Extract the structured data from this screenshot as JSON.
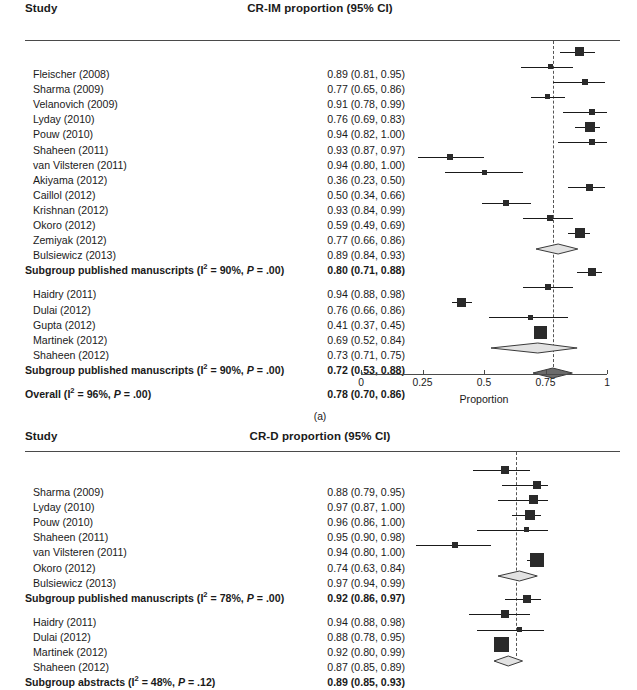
{
  "figure": {
    "caption_a": "(a)",
    "study_header": "Study"
  },
  "panel_a": {
    "effect_header": "CR-IM proportion (95% CI)",
    "axis": {
      "title": "Proportion",
      "ticks": [
        "0",
        "0.25",
        "0.5",
        "0.75",
        "1"
      ],
      "tick_values": [
        0,
        0.25,
        0.5,
        0.75,
        1
      ],
      "range": [
        0,
        1
      ]
    },
    "refline": 0.78,
    "rows": [
      {
        "label": "Fleischer (2008)",
        "value": "0.89 (0.81, 0.95)",
        "est": 0.89,
        "lo": 0.81,
        "hi": 0.95,
        "w": 9,
        "type": "study"
      },
      {
        "label": "Sharma (2009)",
        "value": "0.77 (0.65, 0.86)",
        "est": 0.77,
        "lo": 0.65,
        "hi": 0.86,
        "w": 5,
        "type": "study"
      },
      {
        "label": "Velanovich (2009)",
        "value": "0.91 (0.78, 0.99)",
        "est": 0.91,
        "lo": 0.78,
        "hi": 0.99,
        "w": 6,
        "type": "study"
      },
      {
        "label": "Lyday (2010)",
        "value": "0.76 (0.69, 0.83)",
        "est": 0.76,
        "lo": 0.69,
        "hi": 0.83,
        "w": 5,
        "type": "study"
      },
      {
        "label": "Pouw (2010)",
        "value": "0.94 (0.82, 1.00)",
        "est": 0.94,
        "lo": 0.82,
        "hi": 1.0,
        "w": 6,
        "type": "study"
      },
      {
        "label": "Shaheen (2011)",
        "value": "0.93 (0.87, 0.97)",
        "est": 0.93,
        "lo": 0.87,
        "hi": 0.97,
        "w": 10,
        "type": "study"
      },
      {
        "label": "van Vilsteren (2011)",
        "value": "0.94 (0.80, 1.00)",
        "est": 0.94,
        "lo": 0.8,
        "hi": 1.0,
        "w": 6,
        "type": "study"
      },
      {
        "label": "Akiyama (2012)",
        "value": "0.36 (0.23, 0.50)",
        "est": 0.36,
        "lo": 0.23,
        "hi": 0.5,
        "w": 6,
        "type": "study"
      },
      {
        "label": "Caillol (2012)",
        "value": "0.50 (0.34, 0.66)",
        "est": 0.5,
        "lo": 0.34,
        "hi": 0.66,
        "w": 5,
        "type": "study"
      },
      {
        "label": "Krishnan (2012)",
        "value": "0.93 (0.84, 0.99)",
        "est": 0.93,
        "lo": 0.84,
        "hi": 0.99,
        "w": 7,
        "type": "study"
      },
      {
        "label": "Okoro (2012)",
        "value": "0.59 (0.49, 0.69)",
        "est": 0.59,
        "lo": 0.49,
        "hi": 0.69,
        "w": 6,
        "type": "study"
      },
      {
        "label": "Zemiyak (2012)",
        "value": "0.77 (0.66, 0.86)",
        "est": 0.77,
        "lo": 0.66,
        "hi": 0.86,
        "w": 6,
        "type": "study"
      },
      {
        "label": "Bulsiewicz (2013)",
        "value": "0.89 (0.84, 0.93)",
        "est": 0.89,
        "lo": 0.84,
        "hi": 0.93,
        "w": 10,
        "type": "study"
      },
      {
        "label_html": "Subgroup published manuscripts (I<sup>2</sup> = 90%, <span class=\"ital\">P</span> = .00)",
        "value": "0.80 (0.71, 0.88)",
        "est": 0.8,
        "lo": 0.71,
        "hi": 0.88,
        "type": "summary"
      },
      {
        "type": "gap"
      },
      {
        "label": "Haidry (2011)",
        "value": "0.94 (0.88, 0.98)",
        "est": 0.94,
        "lo": 0.88,
        "hi": 0.98,
        "w": 8,
        "type": "study"
      },
      {
        "label": "Dulai (2012)",
        "value": "0.76 (0.66, 0.86)",
        "est": 0.76,
        "lo": 0.66,
        "hi": 0.86,
        "w": 6,
        "type": "study"
      },
      {
        "label": "Gupta (2012)",
        "value": "0.41 (0.37, 0.45)",
        "est": 0.41,
        "lo": 0.37,
        "hi": 0.45,
        "w": 9,
        "type": "study"
      },
      {
        "label": "Martinek (2012)",
        "value": "0.69 (0.52, 0.84)",
        "est": 0.69,
        "lo": 0.52,
        "hi": 0.84,
        "w": 5,
        "type": "study"
      },
      {
        "label": "Shaheen (2012)",
        "value": "0.73 (0.71, 0.75)",
        "est": 0.73,
        "lo": 0.71,
        "hi": 0.75,
        "w": 13,
        "type": "study"
      },
      {
        "label_html": "Subgroup published manuscripts (I<sup>2</sup> = 90%, <span class=\"ital\">P</span> = .00)",
        "value": "0.72 (0.53, 0.88)",
        "est": 0.72,
        "lo": 0.53,
        "hi": 0.88,
        "type": "summary"
      },
      {
        "type": "gap"
      },
      {
        "label_html": "Overall (I<sup>2</sup> = 96%, <span class=\"ital\">P</span> = .00)",
        "value": "0.78 (0.70, 0.86)",
        "est": 0.78,
        "lo": 0.7,
        "hi": 0.86,
        "type": "overall"
      }
    ]
  },
  "panel_b": {
    "effect_header": "CR-D proportion (95% CI)",
    "refline": 0.91,
    "axis": {
      "range": [
        0.5,
        1.0
      ]
    },
    "rows": [
      {
        "label": "Sharma (2009)",
        "value": "0.88 (0.79, 0.95)",
        "est": 0.88,
        "lo": 0.79,
        "hi": 0.95,
        "w": 8,
        "type": "study"
      },
      {
        "label": "Lyday (2010)",
        "value": "0.97 (0.87, 1.00)",
        "est": 0.97,
        "lo": 0.87,
        "hi": 1.0,
        "w": 8,
        "type": "study"
      },
      {
        "label": "Pouw (2010)",
        "value": "0.96 (0.86, 1.00)",
        "est": 0.96,
        "lo": 0.86,
        "hi": 1.0,
        "w": 9,
        "type": "study"
      },
      {
        "label": "Shaheen (2011)",
        "value": "0.95 (0.90, 0.98)",
        "est": 0.95,
        "lo": 0.9,
        "hi": 0.98,
        "w": 10,
        "type": "study"
      },
      {
        "label": "van Vilsteren (2011)",
        "value": "0.94 (0.80, 1.00)",
        "est": 0.94,
        "lo": 0.8,
        "hi": 1.0,
        "w": 5,
        "type": "study"
      },
      {
        "label": "Okoro (2012)",
        "value": "0.74 (0.63, 0.84)",
        "est": 0.74,
        "lo": 0.63,
        "hi": 0.84,
        "w": 6,
        "type": "study"
      },
      {
        "label": "Bulsiewicz (2013)",
        "value": "0.97 (0.94, 0.99)",
        "est": 0.97,
        "lo": 0.94,
        "hi": 0.99,
        "w": 14,
        "type": "study"
      },
      {
        "label_html": "Subgroup published manuscripts (I<sup>2</sup> = 78%, <span class=\"ital\">P</span> = .00)",
        "value": "0.92 (0.86, 0.97)",
        "est": 0.92,
        "lo": 0.86,
        "hi": 0.97,
        "type": "summary"
      },
      {
        "type": "gap"
      },
      {
        "label": "Haidry (2011)",
        "value": "0.94 (0.88, 0.98)",
        "est": 0.94,
        "lo": 0.88,
        "hi": 0.98,
        "w": 8,
        "type": "study"
      },
      {
        "label": "Dulai (2012)",
        "value": "0.88 (0.78, 0.95)",
        "est": 0.88,
        "lo": 0.78,
        "hi": 0.95,
        "w": 8,
        "type": "study"
      },
      {
        "label": "Martinek (2012)",
        "value": "0.92 (0.80, 0.99)",
        "est": 0.92,
        "lo": 0.8,
        "hi": 0.99,
        "w": 5,
        "type": "study"
      },
      {
        "label": "Shaheen (2012)",
        "value": "0.87 (0.85, 0.89)",
        "est": 0.87,
        "lo": 0.85,
        "hi": 0.89,
        "w": 15,
        "type": "study"
      },
      {
        "label_html": "Subgroup abstracts (I<sup>2</sup> = 48%, <span class=\"ital\">P</span> = .12)",
        "value": "0.89 (0.85, 0.93)",
        "est": 0.89,
        "lo": 0.85,
        "hi": 0.93,
        "type": "summary"
      }
    ]
  },
  "chart_data": {
    "type": "forest",
    "panels": [
      {
        "id": "a",
        "effect_measure": "CR-IM proportion (95% CI)",
        "xlabel": "Proportion",
        "xlim": [
          0,
          1
        ],
        "xticks": [
          0,
          0.25,
          0.5,
          0.75,
          1
        ],
        "refline": 0.78,
        "subgroups": [
          {
            "name": "Subgroup published manuscripts",
            "heterogeneity": {
              "I2": "90%",
              "P": ".00"
            },
            "pooled": {
              "est": 0.8,
              "lo": 0.71,
              "hi": 0.88
            },
            "studies": [
              {
                "study": "Fleischer (2008)",
                "est": 0.89,
                "lo": 0.81,
                "hi": 0.95
              },
              {
                "study": "Sharma (2009)",
                "est": 0.77,
                "lo": 0.65,
                "hi": 0.86
              },
              {
                "study": "Velanovich (2009)",
                "est": 0.91,
                "lo": 0.78,
                "hi": 0.99
              },
              {
                "study": "Lyday (2010)",
                "est": 0.76,
                "lo": 0.69,
                "hi": 0.83
              },
              {
                "study": "Pouw (2010)",
                "est": 0.94,
                "lo": 0.82,
                "hi": 1.0
              },
              {
                "study": "Shaheen (2011)",
                "est": 0.93,
                "lo": 0.87,
                "hi": 0.97
              },
              {
                "study": "van Vilsteren (2011)",
                "est": 0.94,
                "lo": 0.8,
                "hi": 1.0
              },
              {
                "study": "Akiyama (2012)",
                "est": 0.36,
                "lo": 0.23,
                "hi": 0.5
              },
              {
                "study": "Caillol (2012)",
                "est": 0.5,
                "lo": 0.34,
                "hi": 0.66
              },
              {
                "study": "Krishnan (2012)",
                "est": 0.93,
                "lo": 0.84,
                "hi": 0.99
              },
              {
                "study": "Okoro (2012)",
                "est": 0.59,
                "lo": 0.49,
                "hi": 0.69
              },
              {
                "study": "Zemiyak (2012)",
                "est": 0.77,
                "lo": 0.66,
                "hi": 0.86
              },
              {
                "study": "Bulsiewicz (2013)",
                "est": 0.89,
                "lo": 0.84,
                "hi": 0.93
              }
            ]
          },
          {
            "name": "Subgroup published manuscripts",
            "heterogeneity": {
              "I2": "90%",
              "P": ".00"
            },
            "pooled": {
              "est": 0.72,
              "lo": 0.53,
              "hi": 0.88
            },
            "studies": [
              {
                "study": "Haidry (2011)",
                "est": 0.94,
                "lo": 0.88,
                "hi": 0.98
              },
              {
                "study": "Dulai (2012)",
                "est": 0.76,
                "lo": 0.66,
                "hi": 0.86
              },
              {
                "study": "Gupta (2012)",
                "est": 0.41,
                "lo": 0.37,
                "hi": 0.45
              },
              {
                "study": "Martinek (2012)",
                "est": 0.69,
                "lo": 0.52,
                "hi": 0.84
              },
              {
                "study": "Shaheen (2012)",
                "est": 0.73,
                "lo": 0.71,
                "hi": 0.75
              }
            ]
          }
        ],
        "overall": {
          "label": "Overall",
          "heterogeneity": {
            "I2": "96%",
            "P": ".00"
          },
          "est": 0.78,
          "lo": 0.7,
          "hi": 0.86
        }
      },
      {
        "id": "b",
        "effect_measure": "CR-D proportion (95% CI)",
        "xlim": [
          0.5,
          1.0
        ],
        "refline": 0.91,
        "subgroups": [
          {
            "name": "Subgroup published manuscripts",
            "heterogeneity": {
              "I2": "78%",
              "P": ".00"
            },
            "pooled": {
              "est": 0.92,
              "lo": 0.86,
              "hi": 0.97
            },
            "studies": [
              {
                "study": "Sharma (2009)",
                "est": 0.88,
                "lo": 0.79,
                "hi": 0.95
              },
              {
                "study": "Lyday (2010)",
                "est": 0.97,
                "lo": 0.87,
                "hi": 1.0
              },
              {
                "study": "Pouw (2010)",
                "est": 0.96,
                "lo": 0.86,
                "hi": 1.0
              },
              {
                "study": "Shaheen (2011)",
                "est": 0.95,
                "lo": 0.9,
                "hi": 0.98
              },
              {
                "study": "van Vilsteren (2011)",
                "est": 0.94,
                "lo": 0.8,
                "hi": 1.0
              },
              {
                "study": "Okoro (2012)",
                "est": 0.74,
                "lo": 0.63,
                "hi": 0.84
              },
              {
                "study": "Bulsiewicz (2013)",
                "est": 0.97,
                "lo": 0.94,
                "hi": 0.99
              }
            ]
          },
          {
            "name": "Subgroup abstracts",
            "heterogeneity": {
              "I2": "48%",
              "P": ".12"
            },
            "pooled": {
              "est": 0.89,
              "lo": 0.85,
              "hi": 0.93
            },
            "studies": [
              {
                "study": "Haidry (2011)",
                "est": 0.94,
                "lo": 0.88,
                "hi": 0.98
              },
              {
                "study": "Dulai (2012)",
                "est": 0.88,
                "lo": 0.78,
                "hi": 0.95
              },
              {
                "study": "Martinek (2012)",
                "est": 0.92,
                "lo": 0.8,
                "hi": 0.99
              },
              {
                "study": "Shaheen (2012)",
                "est": 0.87,
                "lo": 0.85,
                "hi": 0.89
              }
            ]
          }
        ]
      }
    ]
  }
}
